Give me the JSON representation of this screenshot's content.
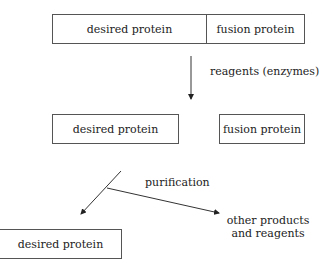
{
  "diagram": {
    "top_box": {
      "left": "desired protein",
      "right": "fusion protein"
    },
    "step1_label": "reagents (enzymes)",
    "middle_boxes": {
      "left": "desired protein",
      "right": "fusion protein"
    },
    "step2_label": "purification",
    "bottom_box": "desired protein",
    "side_output": {
      "line1": "other products",
      "line2": "and reagents"
    }
  }
}
